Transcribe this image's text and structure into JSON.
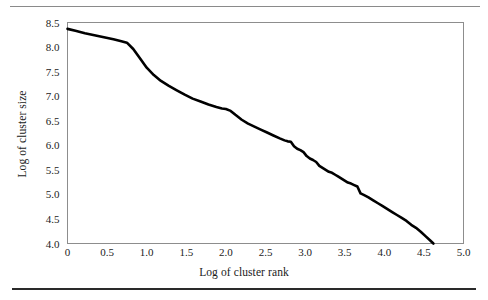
{
  "figure": {
    "kind": "line-chart",
    "rules": {
      "top_rule": "thin-gray-horizontal-rule",
      "bottom_rule": "thick-dark-horizontal-rule"
    }
  },
  "chart_data": {
    "type": "line",
    "title": "",
    "subtitle": "",
    "xlabel": "Log of cluster rank",
    "ylabel": "Log of cluster size",
    "xlim": [
      0,
      5.0
    ],
    "ylim": [
      4.0,
      8.5
    ],
    "xticks": [
      "0",
      "0.5",
      "1.0",
      "1.5",
      "2.0",
      "2.5",
      "3.0",
      "3.5",
      "4.0",
      "4.5",
      "5.0"
    ],
    "xtick_values": [
      0,
      0.5,
      1.0,
      1.5,
      2.0,
      2.5,
      3.0,
      3.5,
      4.0,
      4.5,
      5.0
    ],
    "yticks": [
      "4.0",
      "4.5",
      "5.0",
      "5.5",
      "6.0",
      "6.5",
      "7.0",
      "7.5",
      "8.0",
      "8.5"
    ],
    "ytick_values": [
      4.0,
      4.5,
      5.0,
      5.5,
      6.0,
      6.5,
      7.0,
      7.5,
      8.0,
      8.5
    ],
    "grid": false,
    "legend": false,
    "legend_position": "none",
    "line_color": "#000000",
    "line_width": 2.6,
    "series": [
      {
        "name": "cluster size vs rank",
        "x": [
          0.0,
          0.1,
          0.22,
          0.34,
          0.46,
          0.58,
          0.68,
          0.75,
          0.83,
          0.91,
          1.0,
          1.09,
          1.18,
          1.28,
          1.38,
          1.48,
          1.58,
          1.68,
          1.78,
          1.88,
          1.95,
          2.0,
          2.06,
          2.12,
          2.2,
          2.28,
          2.36,
          2.44,
          2.52,
          2.6,
          2.68,
          2.74,
          2.78,
          2.82,
          2.86,
          2.9,
          2.94,
          2.98,
          3.02,
          3.06,
          3.1,
          3.14,
          3.18,
          3.22,
          3.26,
          3.3,
          3.34,
          3.38,
          3.42,
          3.46,
          3.5,
          3.54,
          3.58,
          3.62,
          3.66,
          3.7,
          3.74,
          3.8,
          3.86,
          3.92,
          3.98,
          4.04,
          4.1,
          4.16,
          4.22,
          4.28,
          4.34,
          4.4,
          4.46,
          4.52,
          4.58,
          4.62
        ],
        "y": [
          8.37,
          8.33,
          8.28,
          8.24,
          8.2,
          8.16,
          8.12,
          8.09,
          7.96,
          7.78,
          7.58,
          7.43,
          7.31,
          7.21,
          7.12,
          7.03,
          6.95,
          6.89,
          6.83,
          6.78,
          6.75,
          6.74,
          6.7,
          6.62,
          6.52,
          6.44,
          6.38,
          6.32,
          6.26,
          6.2,
          6.14,
          6.1,
          6.08,
          6.07,
          5.98,
          5.93,
          5.9,
          5.86,
          5.78,
          5.73,
          5.7,
          5.66,
          5.58,
          5.54,
          5.5,
          5.46,
          5.44,
          5.4,
          5.36,
          5.32,
          5.28,
          5.24,
          5.22,
          5.19,
          5.16,
          5.02,
          4.99,
          4.94,
          4.88,
          4.82,
          4.76,
          4.7,
          4.64,
          4.58,
          4.52,
          4.46,
          4.38,
          4.32,
          4.24,
          4.15,
          4.06,
          4.0
        ]
      }
    ],
    "annotations": []
  }
}
